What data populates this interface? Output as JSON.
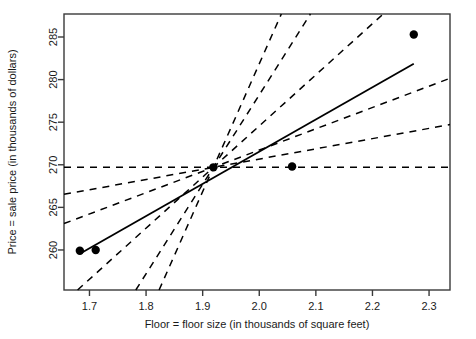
{
  "chart_data": {
    "type": "scatter",
    "title": "",
    "xlabel": "Floor = floor size (in thousands of square feet)",
    "ylabel": "Price = sale price (in thousands of dollars)",
    "xlim": [
      1.655,
      2.337
    ],
    "ylim": [
      255.3,
      287.7
    ],
    "grid": false,
    "legend": "none",
    "xticks": [
      1.7,
      1.8,
      1.9,
      2.0,
      2.1,
      2.2,
      2.3
    ],
    "xticklabels": [
      "1.7",
      "1.8",
      "1.9",
      "2.0",
      "2.1",
      "2.2",
      "2.3"
    ],
    "yticks": [
      260,
      265,
      270,
      275,
      280,
      285
    ],
    "yticklabels": [
      "260",
      "265",
      "270",
      "275",
      "280",
      "285"
    ],
    "point_color": "#000000",
    "line_color": "#000000",
    "points": {
      "x": [
        1.683,
        1.711,
        1.919,
        2.058,
        2.273
      ],
      "y": [
        259.9,
        260.0,
        269.7,
        269.8,
        285.3
      ]
    },
    "fit_line": {
      "name": "least squares regression line",
      "style": "solid",
      "x": [
        1.683,
        2.273
      ],
      "y": [
        259.55,
        281.85
      ]
    },
    "centroid": {
      "x": 1.919,
      "y": 269.7
    },
    "candidate_lines": {
      "name": "candidate lines through the centroid",
      "style": "dashed",
      "count": 6,
      "slopes": [
        0.0,
        12.0,
        25.0,
        60.0,
        105.0,
        150.0
      ],
      "comment": "six dashed lines all passing through the mean point (1.919, 269.7)"
    }
  },
  "axes": {
    "x_title": "Floor = floor size (in thousands of square feet)",
    "y_title": "Price = sale price (in thousands of dollars)"
  },
  "ticks": {
    "x": [
      "1.7",
      "1.8",
      "1.9",
      "2.0",
      "2.1",
      "2.2",
      "2.3"
    ],
    "y": [
      "260",
      "265",
      "270",
      "275",
      "280",
      "285"
    ]
  }
}
